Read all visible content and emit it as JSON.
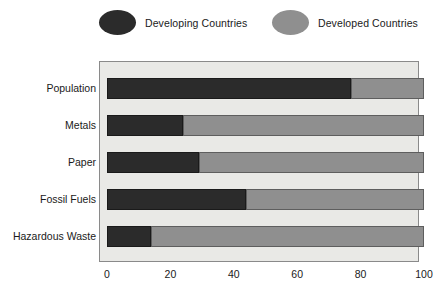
{
  "legend": {
    "items": [
      {
        "label": "Developing Countries",
        "swatch": "dark-ellipse-icon",
        "color": "#2b2b2b"
      },
      {
        "label": "Developed Countries",
        "swatch": "light-ellipse-icon",
        "color": "#8f8f8f"
      }
    ]
  },
  "chart_data": {
    "type": "bar",
    "orientation": "horizontal",
    "stacked": true,
    "title": "",
    "xlabel": "",
    "ylabel": "",
    "categories": [
      "Population",
      "Metals",
      "Paper",
      "Fossil Fuels",
      "Hazardous Waste"
    ],
    "series": [
      {
        "name": "Developing Countries",
        "color": "#2b2b2b",
        "values": [
          77,
          24,
          29,
          44,
          14
        ]
      },
      {
        "name": "Developed Countries",
        "color": "#8f8f8f",
        "values": [
          23,
          76,
          71,
          56,
          86
        ]
      }
    ],
    "xlim": [
      0,
      100
    ],
    "xticks": [
      0,
      20,
      40,
      60,
      80,
      100
    ],
    "xticklabels": [
      "0",
      "20",
      "40",
      "60",
      "80",
      "100"
    ],
    "grid": false,
    "legend_position": "top",
    "plot_background": "#e9e9e6"
  }
}
